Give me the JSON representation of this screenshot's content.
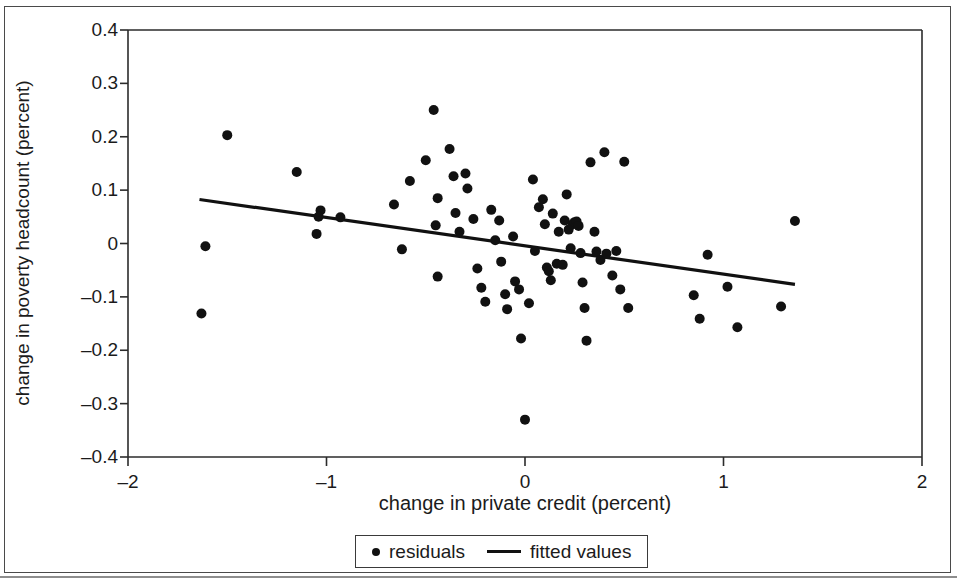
{
  "chart_data": {
    "type": "scatter",
    "title": "",
    "xlabel": "change in private credit (percent)",
    "ylabel": "change in poverty headcount (percent)",
    "xlim": [
      -2,
      2
    ],
    "ylim": [
      -0.4,
      0.4
    ],
    "xticks": [
      -2,
      -1,
      0,
      1,
      2
    ],
    "xtick_labels": [
      "–2",
      "–1",
      "0",
      "1",
      "2"
    ],
    "yticks": [
      -0.4,
      -0.3,
      -0.2,
      -0.1,
      0,
      0.1,
      0.2,
      0.3,
      0.4
    ],
    "ytick_labels": [
      "–0.4",
      "–0.3",
      "–0.2",
      "–0.1",
      "0",
      "0.1",
      "0.2",
      "0.3",
      "0.4"
    ],
    "grid": false,
    "legend_position": "below-axis",
    "series": [
      {
        "name": "residuals",
        "type": "scatter",
        "marker": "circle",
        "color": "#111111",
        "points": [
          [
            -1.61,
            -0.005
          ],
          [
            -1.63,
            -0.131
          ],
          [
            -1.5,
            0.203
          ],
          [
            -1.15,
            0.134
          ],
          [
            -1.03,
            0.062
          ],
          [
            -1.04,
            0.05
          ],
          [
            -1.05,
            0.018
          ],
          [
            -0.93,
            0.049
          ],
          [
            -0.66,
            0.073
          ],
          [
            -0.62,
            -0.011
          ],
          [
            -0.58,
            0.117
          ],
          [
            -0.5,
            0.156
          ],
          [
            -0.46,
            0.25
          ],
          [
            -0.44,
            0.085
          ],
          [
            -0.45,
            0.034
          ],
          [
            -0.44,
            -0.062
          ],
          [
            -0.38,
            0.177
          ],
          [
            -0.36,
            0.126
          ],
          [
            -0.35,
            0.057
          ],
          [
            -0.33,
            0.022
          ],
          [
            -0.3,
            0.131
          ],
          [
            -0.29,
            0.103
          ],
          [
            -0.26,
            0.046
          ],
          [
            -0.24,
            -0.047
          ],
          [
            -0.22,
            -0.083
          ],
          [
            -0.2,
            -0.109
          ],
          [
            -0.17,
            0.063
          ],
          [
            -0.15,
            0.006
          ],
          [
            -0.13,
            0.043
          ],
          [
            -0.12,
            -0.034
          ],
          [
            -0.1,
            -0.095
          ],
          [
            -0.09,
            -0.123
          ],
          [
            -0.06,
            0.013
          ],
          [
            -0.05,
            -0.071
          ],
          [
            -0.03,
            -0.086
          ],
          [
            -0.02,
            -0.178
          ],
          [
            0.0,
            -0.33
          ],
          [
            0.02,
            -0.112
          ],
          [
            0.04,
            0.12
          ],
          [
            0.05,
            -0.014
          ],
          [
            0.07,
            0.068
          ],
          [
            0.09,
            0.083
          ],
          [
            0.1,
            0.036
          ],
          [
            0.11,
            -0.045
          ],
          [
            0.12,
            -0.052
          ],
          [
            0.13,
            -0.069
          ],
          [
            0.14,
            0.056
          ],
          [
            0.16,
            -0.038
          ],
          [
            0.17,
            0.022
          ],
          [
            0.19,
            -0.04
          ],
          [
            0.2,
            0.043
          ],
          [
            0.21,
            0.092
          ],
          [
            0.22,
            0.026
          ],
          [
            0.23,
            -0.009
          ],
          [
            0.24,
            0.036
          ],
          [
            0.25,
            0.04
          ],
          [
            0.26,
            0.041
          ],
          [
            0.27,
            0.033
          ],
          [
            0.28,
            -0.018
          ],
          [
            0.29,
            -0.073
          ],
          [
            0.3,
            -0.121
          ],
          [
            0.31,
            -0.182
          ],
          [
            0.33,
            0.152
          ],
          [
            0.35,
            0.022
          ],
          [
            0.36,
            -0.015
          ],
          [
            0.38,
            -0.031
          ],
          [
            0.4,
            0.171
          ],
          [
            0.41,
            -0.019
          ],
          [
            0.44,
            -0.06
          ],
          [
            0.46,
            -0.014
          ],
          [
            0.48,
            -0.086
          ],
          [
            0.5,
            0.153
          ],
          [
            0.52,
            -0.121
          ],
          [
            0.85,
            -0.097
          ],
          [
            0.88,
            -0.141
          ],
          [
            0.92,
            -0.021
          ],
          [
            1.02,
            -0.081
          ],
          [
            1.07,
            -0.157
          ],
          [
            1.29,
            -0.118
          ],
          [
            1.36,
            0.042
          ]
        ]
      },
      {
        "name": "fitted values",
        "type": "line",
        "color": "#111111",
        "x_start": -1.64,
        "y_start": 0.0825,
        "x_end": 1.36,
        "y_end": -0.0765
      }
    ]
  },
  "legend": {
    "entries": [
      {
        "label": "residuals",
        "marker": "dot-marker"
      },
      {
        "label": "fitted values",
        "marker": "line-marker"
      }
    ]
  }
}
